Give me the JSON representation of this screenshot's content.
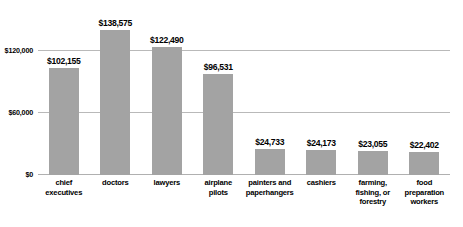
{
  "chart_data": {
    "type": "bar",
    "title": "",
    "xlabel": "",
    "ylabel": "",
    "categories": [
      "chief executives",
      "doctors",
      "lawyers",
      "airplane pilots",
      "painters and paperhangers",
      "cashiers",
      "farming, fishing, or forestry",
      "food preparation workers"
    ],
    "category_lines": [
      [
        "chief",
        "executives"
      ],
      [
        "doctors"
      ],
      [
        "lawyers"
      ],
      [
        "airplane",
        "pilots"
      ],
      [
        "painters and",
        "paperhangers"
      ],
      [
        "cashiers"
      ],
      [
        "farming,",
        "fishing, or",
        "forestry"
      ],
      [
        "food",
        "preparation",
        "workers"
      ]
    ],
    "values": [
      102155,
      138575,
      122490,
      96531,
      24733,
      24173,
      23055,
      22402
    ],
    "value_labels": [
      "$102,155",
      "$138,575",
      "$122,490",
      "$96,531",
      "$24,733",
      "$24,173",
      "$23,055",
      "$22,402"
    ],
    "ylim": [
      0,
      160000
    ],
    "yticks": [
      0,
      60000,
      120000
    ],
    "ytick_labels": [
      "$0",
      "$60,000",
      "$120,000"
    ],
    "grid": true,
    "legend": false,
    "bar_color": "#a3a3a3",
    "gridline_color": "#b9b9b9",
    "text_color": "#000000",
    "background_color": "#ffffff"
  }
}
